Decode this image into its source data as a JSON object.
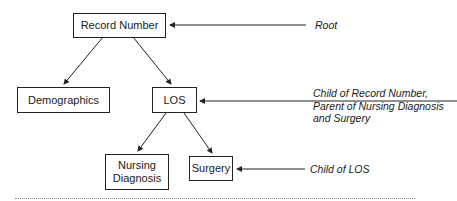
{
  "diagram": {
    "type": "tree",
    "nodes": [
      {
        "id": "record_number",
        "label": "Record Number"
      },
      {
        "id": "demographics",
        "label": "Demographics"
      },
      {
        "id": "los",
        "label": "LOS"
      },
      {
        "id": "nursing_diagnosis",
        "label_line1": "Nursing",
        "label_line2": "Diagnosis"
      },
      {
        "id": "surgery",
        "label": "Surgery"
      }
    ],
    "edges": [
      {
        "from": "record_number",
        "to": "demographics"
      },
      {
        "from": "record_number",
        "to": "los"
      },
      {
        "from": "los",
        "to": "nursing_diagnosis"
      },
      {
        "from": "los",
        "to": "surgery"
      }
    ],
    "annotations": [
      {
        "target": "record_number",
        "text": "Root"
      },
      {
        "target": "los",
        "line1": "Child of Record Number,",
        "line2": "Parent of Nursing Diagnosis",
        "line3": "and Surgery"
      },
      {
        "target": "surgery",
        "text": "Child of LOS"
      }
    ]
  }
}
